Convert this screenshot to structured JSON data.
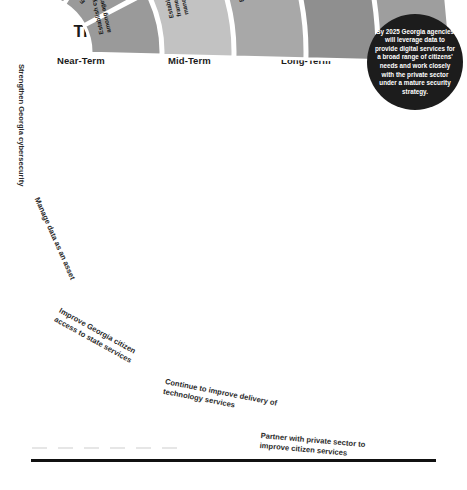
{
  "header": {
    "title": "Timeline for Georgia's 2025 IT Vision"
  },
  "columns": [
    {
      "id": "near",
      "label": "Near-Term"
    },
    {
      "id": "mid",
      "label": "Mid-Term"
    },
    {
      "id": "long",
      "label": "Long-Term"
    }
  ],
  "badge": {
    "text": "By 2025 Georgia agencies will leverage data to provide digital services for a broad range of citizens' needs and work closely with the private sector under a mature security strategy.",
    "color": "#1c1c1c"
  },
  "rows": [
    {
      "id": "cybersecurity",
      "label": "Strengthen Georgia cybersecurity",
      "fill": "#9a9a9a",
      "cells": [
        {
          "term": "near",
          "text": "Establish cyber awareness among agencies; complete Cyber Innovation and Training Center"
        },
        {
          "term": "mid",
          "text": "Establish cyber preparedness among agencies; Develop Cyber Center programs"
        },
        {
          "term": "long",
          "text": "Establish cyber resilience among agencies"
        }
      ]
    },
    {
      "id": "data-asset",
      "label": "Manage data as an asset",
      "fill": "#c2c2c2",
      "cells": [
        {
          "term": "near",
          "text": "Create data inventory and standards"
        },
        {
          "term": "mid",
          "text": "Establish data analytics and reporting dashboards"
        },
        {
          "term": "long",
          "text": "Establish enterprise framework for data management"
        }
      ]
    },
    {
      "id": "citizen-access",
      "label": "Improve Georgia citizen access to state services",
      "fill": "#a8a8a8",
      "cells": [
        {
          "term": "near",
          "text": "View citizens as digital services customers; create agency content strategy marketing"
        },
        {
          "term": "mid",
          "text": "Establish content delivery standards and strategies for emerging user interfaces"
        },
        {
          "term": "long",
          "text": "Establish framework for digital services to citizens"
        }
      ]
    },
    {
      "id": "technology-delivery",
      "label": "Continue to improve delivery of technology services",
      "fill": "#8f8f8f",
      "cells": [
        {
          "term": "near",
          "text": "Establish agency IT project procurement efficiency; grow cloud strategy"
        },
        {
          "term": "mid",
          "text": "Increase cost effectiveness and access to services through emerging technologies"
        },
        {
          "term": "long",
          "text": "Increase third-party service strategy"
        }
      ]
    },
    {
      "id": "private-partner",
      "label": "Partner with private sector to improve citizen services",
      "fill": "#9e9e9e",
      "cells": [
        {
          "term": "near",
          "text": "Streamline software and IT as largest priority initiatives; target priority private innovation"
        },
        {
          "term": "mid",
          "text": "Establish partnerships that allow for wider sourcing of IT risk and resources including state services"
        },
        {
          "term": "long",
          "text": "Normalize private sector partner engagements to integrate innovative technologies"
        }
      ]
    }
  ],
  "chart_data": {
    "type": "table",
    "title": "Timeline for Georgia's 2025 IT Vision",
    "layout": "radial fan / sunburst grid, 5 strategic goal rows by 3 time-horizon columns",
    "columns": [
      "Near-Term",
      "Mid-Term",
      "Long-Term"
    ],
    "categories": [
      "Strengthen Georgia cybersecurity",
      "Manage data as an asset",
      "Improve Georgia citizen access to state services",
      "Continue to improve delivery of technology services",
      "Partner with private sector to improve citizen services"
    ],
    "cells": [
      [
        "Establish cyber awareness among agencies; complete Cyber Innovation and Training Center",
        "Establish cyber preparedness among agencies; Develop Cyber Center programs",
        "Establish cyber resilience among agencies"
      ],
      [
        "Create data inventory and standards",
        "Establish data analytics and reporting dashboards",
        "Establish enterprise framework for data management"
      ],
      [
        "View citizens as digital services customers; create agency content strategy marketing",
        "Establish content delivery standards and strategies for emerging user interfaces",
        "Establish framework for digital services to citizens"
      ],
      [
        "Establish agency IT project procurement efficiency; grow cloud strategy",
        "Increase cost effectiveness and access to services through emerging technologies",
        "Increase third-party service strategy"
      ],
      [
        "Streamline software and IT as largest priority initiatives; target priority private innovation",
        "Establish partnerships that allow for wider sourcing of IT risk and resources including state services",
        "Normalize private sector partner engagements to integrate innovative technologies"
      ]
    ],
    "annotation": "By 2025 Georgia agencies will leverage data to provide digital services for a broad range of citizens' needs and work closely with the private sector under a mature security strategy.",
    "grid": true,
    "legend": "none"
  }
}
